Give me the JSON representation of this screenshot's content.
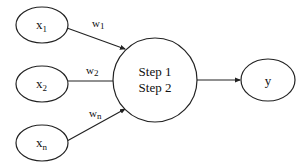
{
  "diagram": {
    "inputs": [
      {
        "base": "x",
        "sub": "1",
        "weight_base": "w",
        "weight_sub": "1"
      },
      {
        "base": "x",
        "sub": "2",
        "weight_base": "w",
        "weight_sub": "2"
      },
      {
        "base": "x",
        "sub": "n",
        "weight_base": "w",
        "weight_sub": "n"
      }
    ],
    "processor": {
      "line1": "Step 1",
      "line2": "Step 2"
    },
    "output": {
      "label": "y"
    },
    "colors": {
      "stroke": "#222222",
      "fill": "#ffffff",
      "background": "#ffffff"
    }
  }
}
